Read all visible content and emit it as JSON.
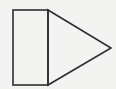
{
  "diagram": {
    "background": "#f3f3f1",
    "stroke_color": "#2e2e2e",
    "stroke_width": 1.6,
    "shapes": [
      {
        "name": "rectangle",
        "type": "rect",
        "x": 13,
        "y": 10,
        "width": 35,
        "height": 75
      },
      {
        "name": "triangle",
        "type": "polygon",
        "points": "48,10 111,48 48,85"
      }
    ]
  }
}
